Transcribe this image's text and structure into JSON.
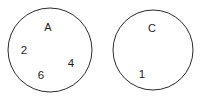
{
  "figure": {
    "background_color": "#ffffff",
    "stroke_color": "#2b2b2b",
    "text_color": "#1c1c1c",
    "width": 203,
    "height": 98
  },
  "sets": [
    {
      "name": "A",
      "name_label": "A",
      "circle": {
        "cx": 50,
        "cy": 50,
        "r": 42
      },
      "name_position": {
        "x": 48,
        "y": 31
      },
      "elements": [
        {
          "value": "2",
          "x": 24,
          "y": 54
        },
        {
          "value": "4",
          "x": 71,
          "y": 67
        },
        {
          "value": "6",
          "x": 41,
          "y": 79
        }
      ]
    },
    {
      "name": "C",
      "name_label": "C",
      "circle": {
        "cx": 153,
        "cy": 50,
        "r": 40
      },
      "name_position": {
        "x": 152,
        "y": 32
      },
      "elements": [
        {
          "value": "1",
          "x": 142,
          "y": 78
        }
      ]
    }
  ],
  "chart_data": {
    "type": "diagram",
    "diagram_kind": "venn-disjoint-sets",
    "title": "",
    "sets": [
      {
        "label": "A",
        "members": [
          "2",
          "4",
          "6"
        ]
      },
      {
        "label": "C",
        "members": [
          "1"
        ]
      }
    ],
    "intersections": []
  }
}
